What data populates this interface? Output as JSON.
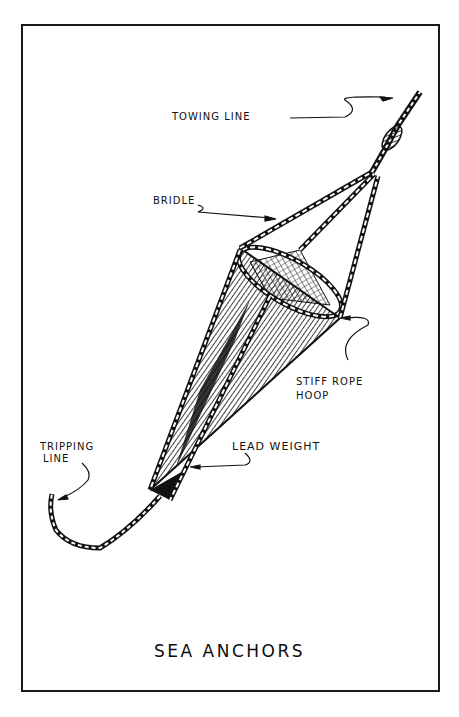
{
  "title": "SEA ANCHORS",
  "labels": {
    "towing_line": "TOWING LINE",
    "bridle": "BRIDLE",
    "stiff_rope_hoop_line1": "STIFF ROPE",
    "stiff_rope_hoop_line2": "HOOP",
    "tripping_line_line1": "TRIPPING",
    "tripping_line_line2": "LINE",
    "lead_weight": "LEAD WEIGHT"
  },
  "colors": {
    "ink": "#111111",
    "paper": "#ffffff"
  }
}
